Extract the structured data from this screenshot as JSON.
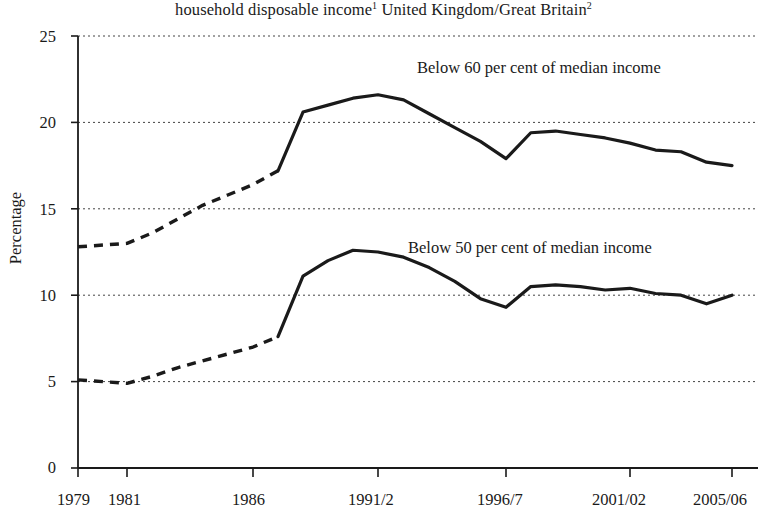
{
  "chart_data": {
    "type": "line",
    "title_main": "household disposable income",
    "title_sup1": "1",
    "title_mid": " United Kingdom/Great Britain",
    "title_sup2": "2",
    "xlabel": "",
    "ylabel": "Percentage",
    "ylim": [
      0,
      25
    ],
    "xlim": [
      1979,
      2005.5
    ],
    "grid": true,
    "grid_style": "dotted-horizontal",
    "legend_position": "inline-annotation",
    "y_ticks": [
      0,
      5,
      10,
      15,
      20,
      25
    ],
    "y_tick_labels": [
      "0",
      "5",
      "10",
      "15",
      "20",
      "25"
    ],
    "x_ticks": [
      1979,
      1981,
      1986,
      1991,
      1996,
      2001,
      2005
    ],
    "x_tick_labels": [
      "1979",
      "1981",
      "1986",
      "1991/2",
      "1996/7",
      "2001/02",
      "2005/06"
    ],
    "line_color": "#1a1a1a",
    "series": [
      {
        "name": "Below 60 per cent of median income",
        "annotation": "Below 60 per cent of median income",
        "annotation_x_px": 417,
        "annotation_y_px": 60,
        "dashed_until_x": 1987,
        "x": [
          1979,
          1981,
          1982,
          1983,
          1984,
          1985,
          1986,
          1987,
          1988,
          1989,
          1990,
          1991,
          1992,
          1993,
          1994,
          1995,
          1996,
          1997,
          1998,
          1999,
          2000,
          2001,
          2002,
          2003,
          2004,
          2005
        ],
        "values": [
          12.8,
          13.0,
          13.6,
          14.4,
          15.2,
          15.8,
          16.4,
          17.2,
          20.6,
          21.0,
          21.4,
          21.6,
          21.3,
          20.5,
          19.7,
          18.9,
          17.9,
          19.4,
          19.5,
          19.3,
          19.1,
          18.8,
          18.4,
          18.3,
          17.7,
          17.5
        ],
        "key_points": {
          "start_1979": 12.8,
          "transition_1987": 17.2,
          "peak_1991": 21.6,
          "trough_1996": 17.9,
          "secondary_peak_1998": 19.5,
          "low_2004": 17.0,
          "end_2005": 17.5
        }
      },
      {
        "name": "Below 50 per cent of median income",
        "annotation": "Below 50 per cent of median income",
        "annotation_x_px": 408,
        "annotation_y_px": 240,
        "dashed_until_x": 1987,
        "x": [
          1979,
          1981,
          1982,
          1983,
          1984,
          1985,
          1986,
          1987,
          1988,
          1989,
          1990,
          1991,
          1992,
          1993,
          1994,
          1995,
          1996,
          1997,
          1998,
          1999,
          2000,
          2001,
          2002,
          2003,
          2004,
          2005
        ],
        "values": [
          5.1,
          4.9,
          5.3,
          5.8,
          6.2,
          6.6,
          7.0,
          7.6,
          11.1,
          12.0,
          12.6,
          12.5,
          12.2,
          11.6,
          10.8,
          9.8,
          9.3,
          10.5,
          10.6,
          10.5,
          10.3,
          10.4,
          10.1,
          10.0,
          9.5,
          10.0
        ],
        "key_points": {
          "start_1979": 5.1,
          "flat_1981": 4.9,
          "transition_1987": 7.6,
          "peak_1990": 12.6,
          "trough_1996": 9.3,
          "plateau_1998": 10.6,
          "low_2004": 9.5,
          "end_2005": 10.0
        }
      }
    ],
    "geometry": {
      "plot_left_px": 78,
      "plot_right_px": 758,
      "y_zero_px": 468,
      "y_top_px": 36,
      "px_per_unit": 17.28,
      "x_1979_px": 78,
      "x_1981_px": 127,
      "x_1986_px": 253,
      "x_1991_px": 378,
      "x_1996_px": 506,
      "x_2001_px": 630,
      "x_2005_px": 732
    }
  }
}
